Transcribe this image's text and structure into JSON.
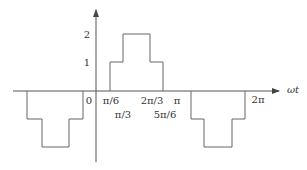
{
  "diagram": {
    "type": "stepped-waveform",
    "axes": {
      "x_label": "ωt",
      "y_ticks": [
        "1",
        "2"
      ],
      "origin_label": "0"
    },
    "x_labels_row1": [
      {
        "text": "π/6",
        "x": 111
      },
      {
        "text": "2π/3",
        "x": 152
      },
      {
        "text": "π",
        "x": 177
      },
      {
        "text": "2π",
        "x": 255
      }
    ],
    "x_labels_row2": [
      {
        "text": "π/3",
        "x": 123
      },
      {
        "text": "5π/6",
        "x": 165
      }
    ],
    "waveform": {
      "levels": [
        0,
        1,
        2,
        1,
        0,
        -1,
        -2,
        -1,
        0
      ],
      "positive_half": "steps up to 1 at π/6, 2 at π/3, back to 1 at 2π/3, 0 at 5π/6",
      "negative_half": "mirror image, negative"
    },
    "colors": {
      "line": "#555555",
      "text": "#333333",
      "background": "#ffffff"
    }
  }
}
